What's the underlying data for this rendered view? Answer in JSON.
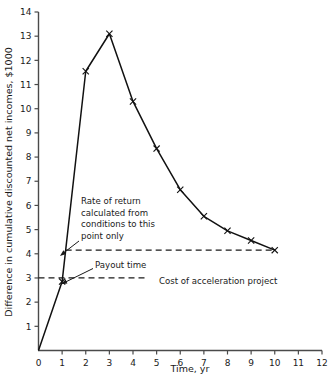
{
  "chart_data": {
    "type": "line",
    "title": "",
    "xlabel": "Time, yr",
    "ylabel": "Difference in cumulative discounted net incomes, $1000",
    "xlim": [
      0,
      12
    ],
    "ylim": [
      0,
      14
    ],
    "xticks": [
      "0",
      "1",
      "2",
      "3",
      "4",
      "5",
      "6",
      "7",
      "8",
      "9",
      "10",
      "11",
      "12"
    ],
    "yticks": [
      "1",
      "2",
      "3",
      "4",
      "5",
      "6",
      "7",
      "8",
      "9",
      "10",
      "11",
      "12",
      "13",
      "14"
    ],
    "grid": false,
    "legend": "none",
    "series": [
      {
        "name": "Difference in cumulative discounted net incomes",
        "marker": "x",
        "x": [
          0,
          1,
          2,
          3,
          4,
          5,
          6,
          7,
          8,
          9,
          10
        ],
        "values": [
          0,
          2.85,
          11.55,
          13.1,
          10.3,
          8.35,
          6.65,
          5.55,
          4.95,
          4.55,
          4.15
        ]
      }
    ],
    "reference_lines": [
      {
        "name": "rate-of-return-level",
        "style": "dashed",
        "y": 4.15,
        "x_start": 1.15,
        "x_end": 10.0
      },
      {
        "name": "cost-of-acceleration-project",
        "style": "dashed",
        "y": 3.0,
        "x_start": 0.0,
        "x_end": 4.6
      }
    ],
    "annotations": [
      {
        "name": "rate-of-return-note",
        "lines": [
          "Rate of return",
          "calculated from",
          "conditions to this",
          "point only"
        ],
        "arrow_to": {
          "x": 1.16,
          "y": 4.15
        }
      },
      {
        "name": "payout-time-note",
        "lines": [
          "Payout time"
        ],
        "arrow_to": {
          "x": 1.0,
          "y": 2.9
        }
      },
      {
        "name": "cost-of-acceleration-label",
        "lines": [
          "Cost of acceleration project"
        ],
        "arrow_to": null
      }
    ],
    "colors": {
      "line": "#111111",
      "axis": "#4a4a4a",
      "dashed": "#1a1a1a",
      "background": "#ffffff",
      "text": "#1a1a1a"
    }
  }
}
